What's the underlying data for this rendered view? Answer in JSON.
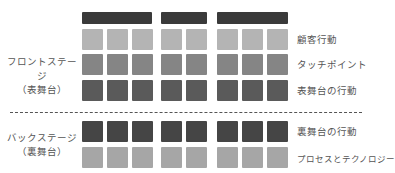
{
  "diagram": {
    "type": "service-blueprint",
    "stages": [
      {
        "id": "front",
        "label_line1": "フロントステージ",
        "label_line2": "（表舞台）"
      },
      {
        "id": "back",
        "label_line1": "バックステージ",
        "label_line2": "（裏舞台）"
      }
    ],
    "rows": [
      {
        "label": "顧客行動",
        "stage": "front",
        "color": "#b4b4b4"
      },
      {
        "label": "タッチポイント",
        "stage": "front",
        "color": "#858585"
      },
      {
        "label": "表舞台の行動",
        "stage": "front",
        "color": "#5a5a5a"
      },
      {
        "label": "裏舞台の行動",
        "stage": "back",
        "color": "#454545"
      },
      {
        "label": "プロセスとテクノロジー",
        "stage": "back",
        "color": "#a6a6a6"
      }
    ],
    "phase_bar_color": "#3a3a3a",
    "phase_groups": [
      {
        "columns": 3
      },
      {
        "columns": 2
      },
      {
        "columns": 3
      }
    ],
    "divider": "dashed"
  }
}
